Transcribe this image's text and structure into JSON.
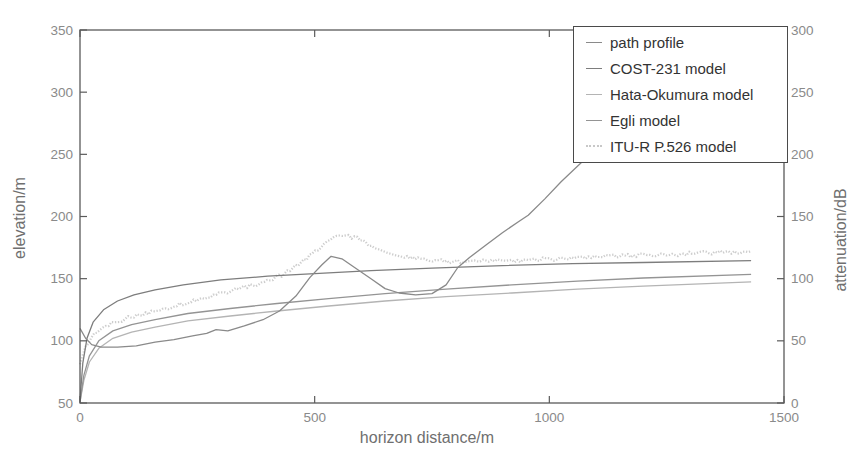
{
  "figure": {
    "background": "#ffffff",
    "frame_color": "#5a5a5a",
    "tick_label_color": "#8a8a8a",
    "axis_title_color": "#6f6f6f",
    "legend_text_color": "#333333",
    "legend_border_color": "#4a4a4a"
  },
  "chart_data": {
    "type": "line",
    "title": "",
    "xlabel": "horizon distance/m",
    "ylabel_left": "elevation/m",
    "ylabel_right": "attenuation/dB",
    "xlim": [
      0,
      1500
    ],
    "ylim_left": [
      50,
      350
    ],
    "ylim_right": [
      0,
      300
    ],
    "xticks": [
      0,
      500,
      1000,
      1500
    ],
    "yticks_left": [
      50,
      100,
      150,
      200,
      250,
      300,
      350
    ],
    "yticks_right": [
      0,
      50,
      100,
      150,
      200,
      250,
      300
    ],
    "grid": false,
    "legend_position": "top-right",
    "series": [
      {
        "name": "path profile",
        "axis": "left",
        "unit": "m",
        "color": "#8a8a8a",
        "style": "solid",
        "points": [
          [
            0,
            110
          ],
          [
            12,
            102
          ],
          [
            25,
            97
          ],
          [
            45,
            95
          ],
          [
            80,
            95
          ],
          [
            120,
            96
          ],
          [
            160,
            99
          ],
          [
            200,
            101
          ],
          [
            240,
            104
          ],
          [
            270,
            106
          ],
          [
            290,
            109
          ],
          [
            315,
            108
          ],
          [
            350,
            112
          ],
          [
            390,
            117
          ],
          [
            425,
            124
          ],
          [
            460,
            136
          ],
          [
            490,
            151
          ],
          [
            515,
            161
          ],
          [
            535,
            168
          ],
          [
            558,
            166
          ],
          [
            585,
            159
          ],
          [
            620,
            150
          ],
          [
            650,
            142
          ],
          [
            680,
            138.5
          ],
          [
            715,
            137
          ],
          [
            750,
            138
          ],
          [
            780,
            145
          ],
          [
            805,
            159
          ],
          [
            830,
            167
          ],
          [
            865,
            177
          ],
          [
            900,
            187
          ],
          [
            935,
            196
          ],
          [
            955,
            201
          ],
          [
            990,
            214
          ],
          [
            1025,
            228
          ],
          [
            1070,
            244
          ]
        ]
      },
      {
        "name": "COST-231 model",
        "axis": "right",
        "unit": "dB",
        "color": "#7d7d7d",
        "style": "solid",
        "points": [
          [
            0,
            2
          ],
          [
            6,
            32
          ],
          [
            15,
            52
          ],
          [
            28,
            65
          ],
          [
            50,
            75
          ],
          [
            80,
            82
          ],
          [
            115,
            87
          ],
          [
            160,
            91
          ],
          [
            220,
            95
          ],
          [
            300,
            99
          ],
          [
            400,
            102
          ],
          [
            500,
            104
          ],
          [
            620,
            106.5
          ],
          [
            750,
            108.5
          ],
          [
            900,
            110.5
          ],
          [
            1050,
            112
          ],
          [
            1200,
            113
          ],
          [
            1430,
            114.5
          ]
        ]
      },
      {
        "name": "Hata-Okumura model",
        "axis": "right",
        "unit": "dB",
        "color": "#b4b4b4",
        "style": "solid",
        "points": [
          [
            0,
            1
          ],
          [
            8,
            18
          ],
          [
            20,
            33
          ],
          [
            40,
            44
          ],
          [
            70,
            52
          ],
          [
            110,
            57
          ],
          [
            160,
            61
          ],
          [
            230,
            66
          ],
          [
            320,
            70
          ],
          [
            420,
            74
          ],
          [
            530,
            78
          ],
          [
            650,
            82
          ],
          [
            780,
            85.5
          ],
          [
            920,
            88.5
          ],
          [
            1060,
            91.5
          ],
          [
            1200,
            94
          ],
          [
            1430,
            97.5
          ]
        ]
      },
      {
        "name": "Egli model",
        "axis": "right",
        "unit": "dB",
        "color": "#949494",
        "style": "solid",
        "points": [
          [
            0,
            1
          ],
          [
            8,
            22
          ],
          [
            20,
            38
          ],
          [
            40,
            50
          ],
          [
            70,
            58
          ],
          [
            110,
            63
          ],
          [
            160,
            67
          ],
          [
            230,
            72
          ],
          [
            320,
            76
          ],
          [
            420,
            80
          ],
          [
            530,
            84
          ],
          [
            650,
            88
          ],
          [
            780,
            91.5
          ],
          [
            920,
            95
          ],
          [
            1060,
            98
          ],
          [
            1200,
            100.5
          ],
          [
            1430,
            103.5
          ]
        ]
      },
      {
        "name": "ITU-R P.526 model",
        "axis": "right",
        "unit": "dB",
        "color": "#c8c8c8",
        "style": "noisy",
        "points": [
          [
            0,
            32
          ],
          [
            12,
            45
          ],
          [
            30,
            55
          ],
          [
            55,
            62
          ],
          [
            90,
            67
          ],
          [
            140,
            72
          ],
          [
            200,
            78
          ],
          [
            260,
            84
          ],
          [
            320,
            90
          ],
          [
            380,
            96
          ],
          [
            430,
            103
          ],
          [
            465,
            111
          ],
          [
            495,
            120
          ],
          [
            520,
            127
          ],
          [
            540,
            132
          ],
          [
            560,
            134.5
          ],
          [
            585,
            133
          ],
          [
            615,
            128
          ],
          [
            645,
            122
          ],
          [
            680,
            118
          ],
          [
            720,
            115.5
          ],
          [
            770,
            114
          ],
          [
            840,
            113.5
          ],
          [
            920,
            114.5
          ],
          [
            1010,
            116
          ],
          [
            1120,
            117.5
          ],
          [
            1250,
            119.5
          ],
          [
            1430,
            122
          ]
        ]
      }
    ]
  }
}
